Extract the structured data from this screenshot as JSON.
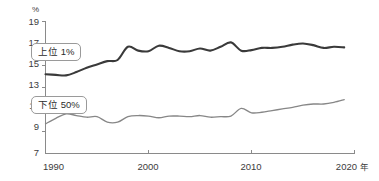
{
  "chart_data": {
    "type": "line",
    "title": "",
    "subtitle": "",
    "xlabel": "年",
    "ylabel": "%",
    "unit_label": "%",
    "x_unit_label": "年",
    "xlim": [
      1990,
      2020
    ],
    "ylim": [
      7,
      19
    ],
    "grid": false,
    "legend_position": "inline-left",
    "y_ticks": [
      19,
      17,
      15,
      13,
      11,
      9,
      7
    ],
    "y_tick_labels": [
      "19",
      "17",
      "15",
      "13",
      "11",
      "9",
      "7"
    ],
    "x_ticks": [
      1990,
      2000,
      2010,
      2020
    ],
    "x_tick_labels": [
      "1990",
      "2000",
      "2010",
      "2020"
    ],
    "x": [
      1990,
      1991,
      1992,
      1993,
      1994,
      1995,
      1996,
      1997,
      1998,
      1999,
      2000,
      2001,
      2002,
      2003,
      2004,
      2005,
      2006,
      2007,
      2008,
      2009,
      2010,
      2011,
      2012,
      2013,
      2014,
      2015,
      2016,
      2017,
      2018,
      2019
    ],
    "series": [
      {
        "name": "上位 1%",
        "color": "#3a3a3a",
        "line_width": 2.1,
        "values": [
          14.2,
          14.15,
          14.1,
          14.4,
          14.8,
          15.1,
          15.4,
          15.5,
          16.7,
          16.35,
          16.3,
          16.8,
          16.6,
          16.3,
          16.3,
          16.55,
          16.35,
          16.7,
          17.1,
          16.35,
          16.4,
          16.6,
          16.6,
          16.7,
          16.9,
          17.0,
          16.85,
          16.6,
          16.7,
          16.65
        ]
      },
      {
        "name": "下位 50%",
        "color": "#878787",
        "line_width": 1.35,
        "values": [
          9.7,
          10.2,
          10.6,
          10.45,
          10.3,
          10.35,
          9.85,
          9.85,
          10.35,
          10.45,
          10.4,
          10.25,
          10.4,
          10.4,
          10.35,
          10.45,
          10.3,
          10.35,
          10.4,
          11.1,
          10.7,
          10.75,
          10.9,
          11.05,
          11.2,
          11.4,
          11.5,
          11.5,
          11.65,
          11.9
        ]
      }
    ],
    "annotations": [
      {
        "name": "上位 1%",
        "kind": "inline-legend-box"
      },
      {
        "name": "下位 50%",
        "kind": "inline-legend-box"
      }
    ]
  },
  "legend": {
    "top_label": "上位 1%",
    "bottom_label": "下位 50%"
  },
  "axes": {
    "y_unit": "%",
    "x_unit": "年"
  }
}
